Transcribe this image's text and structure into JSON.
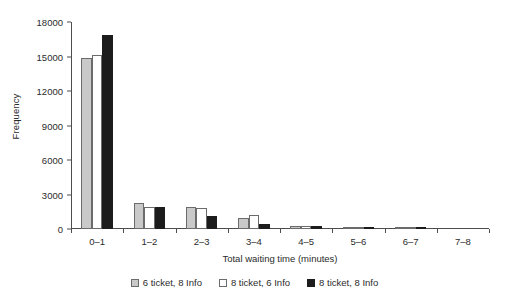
{
  "chart_data": {
    "type": "bar",
    "title": "",
    "xlabel": "Total waiting time (minutes)",
    "ylabel": "Frequency",
    "categories": [
      "0–1",
      "1–2",
      "2–3",
      "3–4",
      "4–5",
      "5–6",
      "6–7",
      "7–8"
    ],
    "yticks": [
      0,
      3000,
      6000,
      9000,
      12000,
      15000,
      18000
    ],
    "ytick_labels": [
      "0",
      "3000",
      "6000",
      "9000",
      "12000",
      "15000",
      "18000"
    ],
    "ylim": [
      0,
      18000
    ],
    "grid": false,
    "legend_position": "bottom",
    "series": [
      {
        "name": "6 ticket, 8 Info",
        "color": "#c9c9c9",
        "edge_color": "#6b6b6b",
        "values": [
          14900,
          2300,
          1900,
          950,
          250,
          130,
          40,
          0
        ]
      },
      {
        "name": "8 ticket, 6 Info",
        "color": "#ffffff",
        "edge_color": "#6b6b6b",
        "values": [
          15100,
          1900,
          1850,
          1250,
          280,
          150,
          50,
          0
        ]
      },
      {
        "name": "8 ticket, 8 Info",
        "color": "#1c1c1c",
        "edge_color": "#1c1c1c",
        "values": [
          16900,
          1950,
          1150,
          450,
          220,
          90,
          20,
          0
        ]
      }
    ]
  },
  "axis": {
    "tick_color": "#4d4d4d",
    "text_color": "#2b2b2b"
  }
}
